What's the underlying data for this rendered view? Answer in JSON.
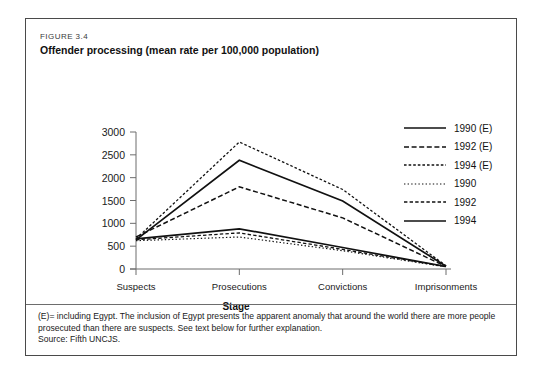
{
  "figure": {
    "number": "FIGURE 3.4",
    "title": "Offender processing (mean rate per 100,000 population)"
  },
  "footnote": {
    "note": "(E)= including Egypt. The inclusion of Egypt presents the apparent anomaly that around the world there are more people prosecuted than there are suspects. See text below for further explanation.",
    "source": "Source: Fifth UNCJS."
  },
  "chart_data": {
    "type": "line",
    "title": "Offender processing (mean rate per 100,000 population)",
    "xlabel": "Stage",
    "ylabel": "",
    "categories": [
      "Suspects",
      "Prosecutions",
      "Convictions",
      "Imprisonments"
    ],
    "ylim": [
      0,
      3000
    ],
    "yticks": [
      0,
      500,
      1000,
      1500,
      2000,
      2500,
      3000
    ],
    "ytick_labels": [
      "0",
      "500",
      "1000",
      "1500",
      "2000",
      "2500",
      "3000"
    ],
    "grid": false,
    "legend_position": "right",
    "series": [
      {
        "name": "1990 (E)",
        "style": "solid",
        "values": [
          640,
          2380,
          1490,
          60
        ]
      },
      {
        "name": "1992 (E)",
        "style": "dashed",
        "values": [
          700,
          1800,
          1120,
          55
        ]
      },
      {
        "name": "1994 (E)",
        "style": "fine-dashed",
        "values": [
          660,
          2780,
          1740,
          70
        ]
      },
      {
        "name": "1990",
        "style": "dotted",
        "values": [
          620,
          700,
          400,
          45
        ]
      },
      {
        "name": "1992",
        "style": "dashed-thin",
        "values": [
          640,
          790,
          430,
          50
        ]
      },
      {
        "name": "1994",
        "style": "solid",
        "values": [
          660,
          880,
          470,
          55
        ]
      }
    ]
  },
  "legend": {
    "items": [
      {
        "label": "1990 (E)",
        "style": "solid"
      },
      {
        "label": "1992 (E)",
        "style": "dashed"
      },
      {
        "label": "1994 (E)",
        "style": "fine-dashed"
      },
      {
        "label": "1990",
        "style": "dotted"
      },
      {
        "label": "1992",
        "style": "dashed-thin"
      },
      {
        "label": "1994",
        "style": "solid"
      }
    ]
  },
  "axis": {
    "x_title": "Stage"
  }
}
